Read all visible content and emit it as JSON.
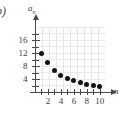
{
  "part_label": "b)",
  "chart_data": {
    "type": "scatter",
    "title": "",
    "xlabel": "n",
    "ylabel": "a_n",
    "x": [
      1,
      2,
      3,
      4,
      5,
      6,
      7,
      8,
      9,
      10
    ],
    "values": [
      12,
      9,
      6.6,
      5.2,
      4.2,
      3.5,
      2.9,
      2.4,
      2.0,
      1.7
    ],
    "series": [
      {
        "name": "a_n",
        "values": [
          12,
          9,
          6.6,
          5.2,
          4.2,
          3.5,
          2.9,
          2.4,
          2.0,
          1.7
        ]
      }
    ],
    "xlim": [
      0,
      10.8
    ],
    "ylim": [
      0,
      20
    ],
    "x_ticks": [
      1,
      2,
      3,
      4,
      5,
      6,
      7,
      8,
      9,
      10
    ],
    "x_tick_labels": [
      "",
      "2",
      "",
      "4",
      "",
      "6",
      "",
      "8",
      "",
      "10"
    ],
    "y_ticks": [
      2,
      4,
      6,
      8,
      10,
      12,
      14,
      16,
      18
    ],
    "y_tick_labels": [
      "",
      "4",
      "",
      "8",
      "",
      "12",
      "",
      "16",
      ""
    ],
    "grid": true,
    "legend": "none",
    "marker": "filled-circle",
    "marker_color": "#141414",
    "axis_color": "#4a4a4a",
    "grid_color": "#e6e6e6"
  }
}
